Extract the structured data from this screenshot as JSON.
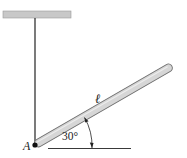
{
  "diagram": {
    "labels": {
      "pivot": "A",
      "length": "ℓ",
      "angle": "30°"
    },
    "colors": {
      "ceiling": "#c8c8c8",
      "rod_fill": "#d6d6d6",
      "rod_stroke": "#707070",
      "line": "#222222"
    }
  }
}
